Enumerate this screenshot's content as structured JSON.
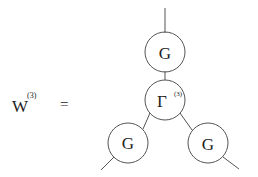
{
  "equation": {
    "lhs_symbol": "W",
    "lhs_superscript": "(3)",
    "equals": "="
  },
  "diagram": {
    "nodes": [
      {
        "id": "top",
        "label": "G",
        "superscript": ""
      },
      {
        "id": "center",
        "label": "Γ",
        "superscript": "(3)"
      },
      {
        "id": "bottom-left",
        "label": "G",
        "superscript": ""
      },
      {
        "id": "bottom-right",
        "label": "G",
        "superscript": ""
      }
    ]
  }
}
